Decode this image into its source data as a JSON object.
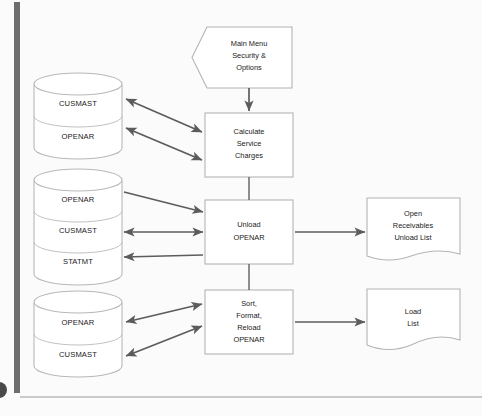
{
  "diagram": {
    "colors": {
      "shape_outline": "#b4b4b4",
      "arrow": "#5c5c5c",
      "text": "#1a1a1a",
      "rail": "#6e6e6e",
      "background": "#fbfbfb"
    },
    "terminator": {
      "id": "main-menu",
      "shape": "pentagon-chevron",
      "lines": [
        "Main Menu",
        "Security &",
        "Options"
      ]
    },
    "processes": [
      {
        "id": "calculate-service-charges",
        "shape": "rectangle",
        "lines": [
          "Calculate",
          "Service",
          "Charges"
        ]
      },
      {
        "id": "unload-openar",
        "shape": "rectangle",
        "lines": [
          "Unload",
          "OPENAR"
        ]
      },
      {
        "id": "sort-format-reload-openar",
        "shape": "rectangle",
        "lines": [
          "Sort,",
          "Format,",
          "Reload",
          "OPENAR"
        ]
      }
    ],
    "data_stores": [
      {
        "id": "store-group-1",
        "shape": "cylinder-stack",
        "files": [
          "CUSMAST",
          "OPENAR"
        ]
      },
      {
        "id": "store-group-2",
        "shape": "cylinder-stack",
        "files": [
          "OPENAR",
          "CUSMAST",
          "STATMT"
        ]
      },
      {
        "id": "store-group-3",
        "shape": "cylinder-stack",
        "files": [
          "OPENAR",
          "CUSMAST"
        ]
      }
    ],
    "documents": [
      {
        "id": "open-receivables-unload-list",
        "shape": "document",
        "lines": [
          "Open",
          "Receivables",
          "Unload List"
        ]
      },
      {
        "id": "load-list",
        "shape": "document",
        "lines": [
          "Load",
          "List"
        ]
      }
    ],
    "connectors": [
      {
        "id": "menu-to-calculate",
        "from": "main-menu",
        "to": "calculate-service-charges",
        "style": "arrow-down"
      },
      {
        "id": "calculate-to-unload",
        "from": "calculate-service-charges",
        "to": "unload-openar",
        "style": "line"
      },
      {
        "id": "unload-to-sort",
        "from": "unload-openar",
        "to": "sort-format-reload-openar",
        "style": "line"
      },
      {
        "id": "cusmast-1-calculate",
        "from": "store-group-1",
        "to": "calculate-service-charges",
        "style": "double-arrow"
      },
      {
        "id": "openar-1-calculate",
        "from": "store-group-1",
        "to": "calculate-service-charges",
        "style": "double-arrow"
      },
      {
        "id": "openar-2-unload",
        "from": "store-group-2",
        "to": "unload-openar",
        "style": "arrow-right"
      },
      {
        "id": "cusmast-2-unload",
        "from": "store-group-2",
        "to": "unload-openar",
        "style": "double-arrow"
      },
      {
        "id": "statmt-2-unload",
        "from": "unload-openar",
        "to": "store-group-2",
        "style": "arrow-left"
      },
      {
        "id": "unload-to-unload-list",
        "from": "unload-openar",
        "to": "open-receivables-unload-list",
        "style": "arrow-right"
      },
      {
        "id": "openar-3-sort",
        "from": "store-group-3",
        "to": "sort-format-reload-openar",
        "style": "double-arrow"
      },
      {
        "id": "cusmast-3-sort",
        "from": "store-group-3",
        "to": "sort-format-reload-openar",
        "style": "double-arrow"
      },
      {
        "id": "sort-to-load-list",
        "from": "sort-format-reload-openar",
        "to": "load-list",
        "style": "arrow-right"
      }
    ]
  }
}
